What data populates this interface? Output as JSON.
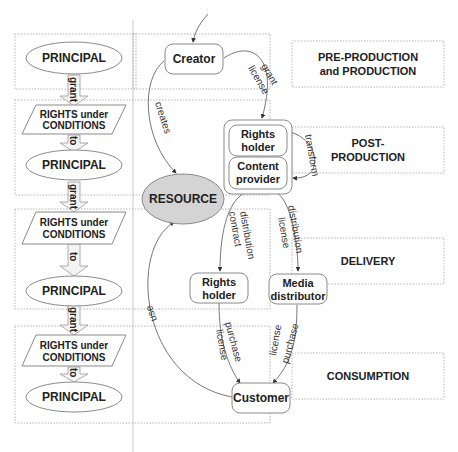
{
  "stages": [
    {
      "line1": "PRE-PRODUCTION",
      "line2": "and PRODUCTION"
    },
    {
      "line1": "POST-",
      "line2": "PRODUCTION"
    },
    {
      "line1": "DELIVERY"
    },
    {
      "line1": "CONSUMPTION"
    }
  ],
  "left_chain": {
    "principal": "PRINCIPAL",
    "rights_line1": "RIGHTS under",
    "rights_line2": "CONDITIONS",
    "grant": "grant",
    "to": "to"
  },
  "nodes": {
    "creator": "Creator",
    "rights_holder_1": "Rights",
    "rights_holder_2": "holder",
    "content_provider_1": "Content",
    "content_provider_2": "provider",
    "resource": "RESOURCE",
    "rights_holder_b1": "Rights",
    "rights_holder_b2": "holder",
    "media_distributor_1": "Media",
    "media_distributor_2": "distributor",
    "customer": "Customer"
  },
  "edges": {
    "creates": "creates",
    "grant_license_1": "grant",
    "grant_license_2": "license",
    "transform": "transform",
    "distribution_contract_1": "distribution",
    "distribution_contract_2": "contract",
    "distribution_license_1": "distribution",
    "distribution_license_2": "license",
    "purchase_license_a1": "purchase",
    "purchase_license_a2": "license",
    "purchase_license_b1": "purchase",
    "purchase_license_b2": "license",
    "use": "use"
  }
}
